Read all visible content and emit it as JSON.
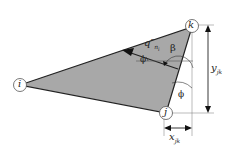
{
  "diagram": {
    "nodes": [
      {
        "id": "i",
        "label": "i"
      },
      {
        "id": "j",
        "label": "j"
      },
      {
        "id": "k",
        "label": "k"
      }
    ],
    "flux_label": "q″",
    "flux_sub": "n",
    "flux_subsub": "i",
    "angle_beta": "β",
    "angle_phi_top": "ϕ",
    "angle_phi_bottom": "ϕ",
    "dim_y": "y",
    "dim_y_sub": "jk",
    "dim_x": "x",
    "dim_x_sub": "jk",
    "colors": {
      "fill": "#a8a8a8",
      "stroke": "#222222"
    }
  }
}
